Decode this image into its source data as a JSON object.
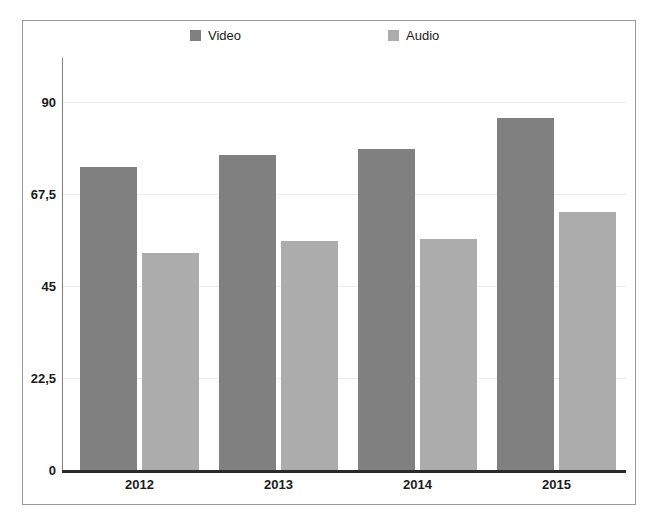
{
  "chart_data": {
    "type": "bar",
    "title": "",
    "subtitle": "",
    "xlabel": "",
    "ylabel": "",
    "categories": [
      "2012",
      "2013",
      "2014",
      "2015"
    ],
    "series": [
      {
        "name": "Video",
        "color": "#808080",
        "values": [
          74,
          77,
          78.5,
          86
        ]
      },
      {
        "name": "Audio",
        "color": "#acacac",
        "values": [
          53,
          56,
          56.5,
          63
        ]
      }
    ],
    "ylim": [
      0,
      90
    ],
    "yticks": [
      0,
      22.5,
      45,
      67.5,
      90
    ],
    "ytick_labels": [
      "0",
      "22,5",
      "45",
      "67,5",
      "90"
    ],
    "grid": true,
    "legend_position": "top"
  },
  "legend": {
    "items": [
      {
        "label": "Video",
        "swatch_color": "#808080"
      },
      {
        "label": "Audio",
        "swatch_color": "#acacac"
      }
    ]
  },
  "axes": {
    "y_tick_labels": [
      "90",
      "67,5",
      "45",
      "22,5",
      "0"
    ],
    "x_tick_labels": [
      "2012",
      "2013",
      "2014",
      "2015"
    ]
  },
  "colors": {
    "video_bar": "#808080",
    "audio_bar": "#acacac",
    "axis": "#2a2a2a",
    "frame_border": "#9a9a9a",
    "gridline": "#ededed",
    "text": "#1b1b1b",
    "background": "#ffffff"
  }
}
